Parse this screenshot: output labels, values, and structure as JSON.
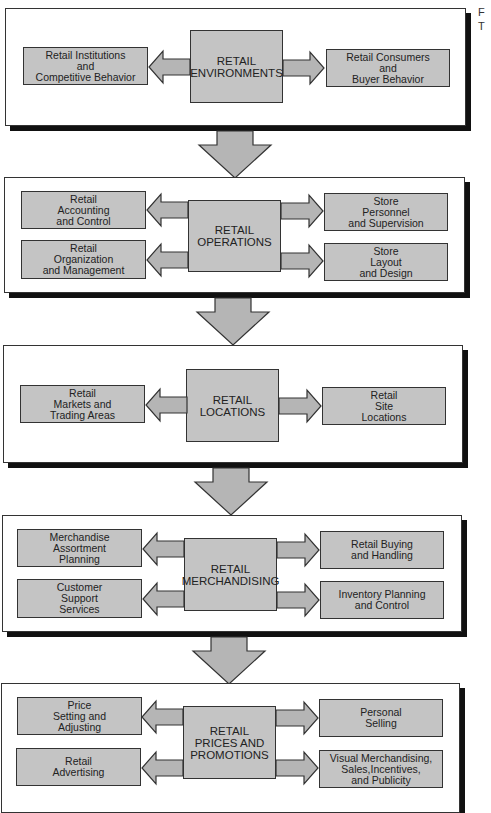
{
  "diagram": {
    "corner_text": [
      "F",
      "T"
    ],
    "colors": {
      "box_fill": "#c4c4c4",
      "arrow_fill": "#b5b5b5",
      "border": "#333333",
      "shadow": "#111111",
      "panel_bg": "#ffffff"
    },
    "stages": [
      {
        "center": "RETAIL\nENVIRONMENTS",
        "left": [
          "Retail Institutions\nand\nCompetitive Behavior"
        ],
        "right": [
          "Retail Consumers\nand\nBuyer Behavior"
        ]
      },
      {
        "center": "RETAIL\nOPERATIONS",
        "left": [
          "Retail\nAccounting\nand Control",
          "Retail\nOrganization\nand Management"
        ],
        "right": [
          "Store\nPersonnel\nand Supervision",
          "Store\nLayout\nand Design"
        ]
      },
      {
        "center": "RETAIL\nLOCATIONS",
        "left": [
          "Retail\nMarkets and\nTrading Areas"
        ],
        "right": [
          "Retail\nSite\nLocations"
        ]
      },
      {
        "center": "RETAIL\nMERCHANDISING",
        "left": [
          "Merchandise\nAssortment\nPlanning",
          "Customer\nSupport\nServices"
        ],
        "right": [
          "Retail Buying\nand Handling",
          "Inventory Planning\nand Control"
        ]
      },
      {
        "center": "RETAIL\nPRICES AND\nPROMOTIONS",
        "left": [
          "Price\nSetting and\nAdjusting",
          "Retail\nAdvertising"
        ],
        "right": [
          "Personal\nSelling",
          "Visual Merchandising,\nSales,Incentives,\nand Publicity"
        ]
      }
    ],
    "flow_arrows": 4
  }
}
